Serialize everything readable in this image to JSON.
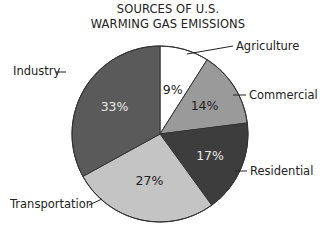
{
  "chart_data": {
    "type": "pie",
    "title_lines": [
      "SOURCES OF U.S.",
      "WARMING GAS EMISSIONS"
    ],
    "categories": [
      "Agriculture",
      "Commercial",
      "Residential",
      "Transportation",
      "Industry"
    ],
    "values": [
      9,
      14,
      17,
      27,
      33
    ],
    "unit": "%",
    "value_labels": [
      "9%",
      "14%",
      "17%",
      "27%",
      "33%"
    ],
    "colors": [
      "#ffffff",
      "#9a9a9a",
      "#3d3d3d",
      "#c4c4c4",
      "#5a5a5a"
    ],
    "start_angle": "12 o'clock",
    "direction": "clockwise",
    "legend": "none (callout labels)"
  }
}
